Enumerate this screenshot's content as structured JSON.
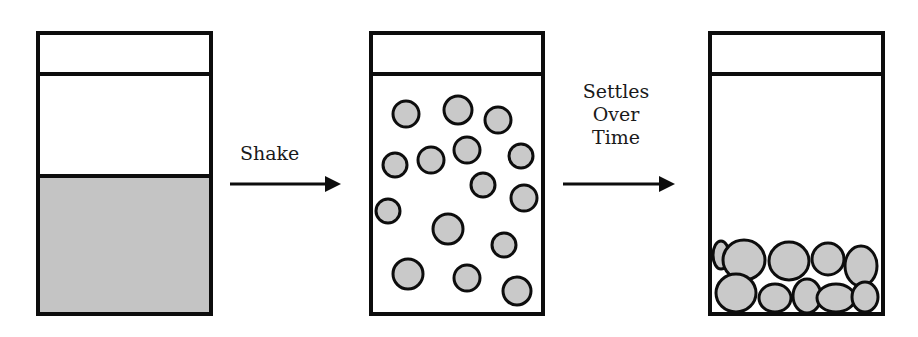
{
  "diagram": {
    "colors": {
      "stroke": "#0d0d0d",
      "particle_fill": "#c9c9c9",
      "sediment_fill": "#c4c4c4",
      "background": "#ffffff"
    },
    "containers": [
      {
        "id": "before",
        "state": "settled-layer",
        "x": 38,
        "y": 33,
        "w": 173,
        "h": 281,
        "lid_y": 74,
        "sediment_top": 176
      },
      {
        "id": "shaken",
        "state": "suspended",
        "x": 371,
        "y": 33,
        "w": 172,
        "h": 281,
        "lid_y": 74,
        "particles": [
          {
            "cx": 406,
            "cy": 114,
            "r": 13
          },
          {
            "cx": 458,
            "cy": 110,
            "r": 14
          },
          {
            "cx": 498,
            "cy": 120,
            "r": 13
          },
          {
            "cx": 395,
            "cy": 165,
            "r": 12
          },
          {
            "cx": 431,
            "cy": 160,
            "r": 13
          },
          {
            "cx": 467,
            "cy": 150,
            "r": 13
          },
          {
            "cx": 521,
            "cy": 156,
            "r": 12
          },
          {
            "cx": 483,
            "cy": 185,
            "r": 12
          },
          {
            "cx": 524,
            "cy": 198,
            "r": 13
          },
          {
            "cx": 388,
            "cy": 211,
            "r": 12
          },
          {
            "cx": 448,
            "cy": 229,
            "r": 15
          },
          {
            "cx": 504,
            "cy": 245,
            "r": 12
          },
          {
            "cx": 408,
            "cy": 274,
            "r": 15
          },
          {
            "cx": 467,
            "cy": 278,
            "r": 13
          },
          {
            "cx": 517,
            "cy": 291,
            "r": 14
          }
        ]
      },
      {
        "id": "after",
        "state": "settled-aggregates",
        "x": 710,
        "y": 33,
        "w": 173,
        "h": 281,
        "lid_y": 74,
        "particles": [
          {
            "cx": 721,
            "cy": 255,
            "rx": 8,
            "ry": 14
          },
          {
            "cx": 744,
            "cy": 260,
            "rx": 21,
            "ry": 20
          },
          {
            "cx": 789,
            "cy": 261,
            "rx": 20,
            "ry": 19
          },
          {
            "cx": 828,
            "cy": 259,
            "rx": 16,
            "ry": 16
          },
          {
            "cx": 861,
            "cy": 266,
            "rx": 16,
            "ry": 20
          },
          {
            "cx": 736,
            "cy": 293,
            "rx": 20,
            "ry": 19
          },
          {
            "cx": 775,
            "cy": 298,
            "rx": 16,
            "ry": 14
          },
          {
            "cx": 807,
            "cy": 296,
            "rx": 14,
            "ry": 17
          },
          {
            "cx": 836,
            "cy": 298,
            "rx": 19,
            "ry": 14
          },
          {
            "cx": 865,
            "cy": 297,
            "rx": 13,
            "ry": 15
          }
        ]
      }
    ],
    "arrows": [
      {
        "x1": 230,
        "x2": 341,
        "y": 184,
        "label": "Shake"
      },
      {
        "x1": 563,
        "x2": 675,
        "y": 184,
        "label_lines": [
          "Settles",
          "Over",
          "Time"
        ]
      }
    ]
  }
}
